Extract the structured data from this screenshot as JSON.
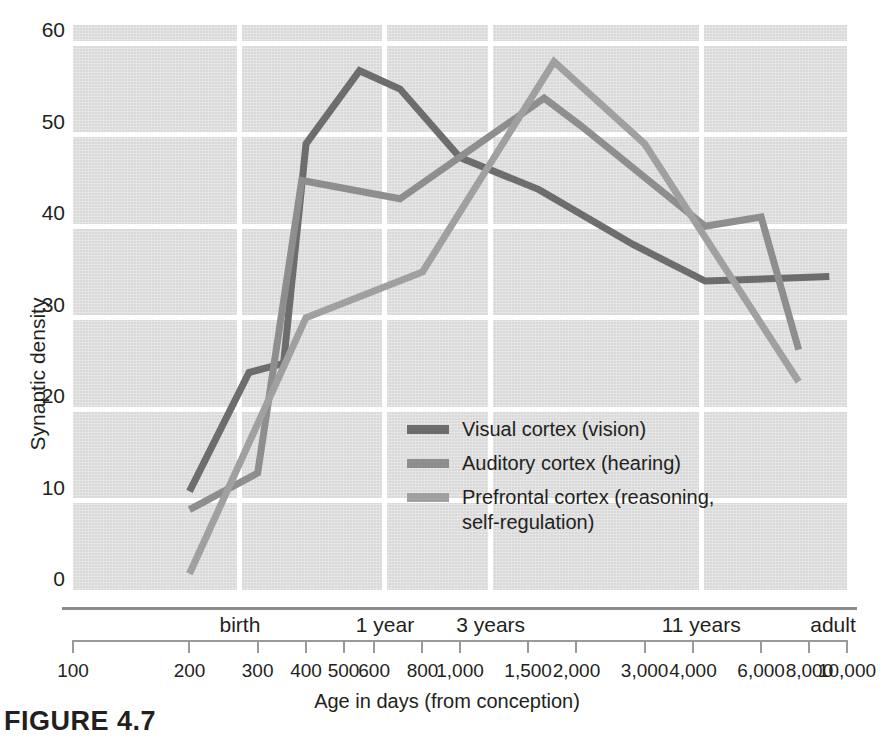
{
  "chart_data": {
    "type": "line",
    "title": "",
    "xlabel": "Age in days (from conception)",
    "ylabel": "Synaptic density",
    "xscale": "log",
    "xlim": [
      100,
      10000
    ],
    "ylim": [
      0,
      62
    ],
    "yticks": [
      0,
      10,
      20,
      30,
      40,
      50,
      60
    ],
    "grid": true,
    "legend_position": "inside-center-left",
    "x_ruler_ticks": [
      100,
      200,
      300,
      400,
      500,
      600,
      800,
      1000,
      1500,
      2000,
      3000,
      4000,
      6000,
      8000,
      10000
    ],
    "x_ruler_labels": [
      "100",
      "200",
      "300",
      "400",
      "500",
      "600",
      "800",
      "1,000",
      "1,500",
      "2,000",
      "3,000",
      "4,000",
      "6,000",
      "8,000",
      "10,000"
    ],
    "x_stage_markers": [
      {
        "label": "birth",
        "days": 270
      },
      {
        "label": "1 year",
        "days": 640
      },
      {
        "label": "3 years",
        "days": 1200
      },
      {
        "label": "11 years",
        "days": 4200
      },
      {
        "label": "adult",
        "days": 9200
      }
    ],
    "gridlines_x_days": [
      270,
      640,
      1200,
      4200
    ],
    "series": [
      {
        "name": "Visual cortex (vision)",
        "color": "#6d6d6d",
        "points": [
          [
            200,
            11.0
          ],
          [
            285,
            24.0
          ],
          [
            350,
            25.0
          ],
          [
            400,
            49.0
          ],
          [
            550,
            57.0
          ],
          [
            700,
            55.0
          ],
          [
            1000,
            47.5
          ],
          [
            1600,
            44.0
          ],
          [
            2800,
            38.0
          ],
          [
            4300,
            34.0
          ],
          [
            9000,
            34.5
          ]
        ]
      },
      {
        "name": "Auditory cortex (hearing)",
        "color": "#8e8e8e",
        "points": [
          [
            200,
            9.0
          ],
          [
            300,
            13.0
          ],
          [
            390,
            45.0
          ],
          [
            700,
            43.0
          ],
          [
            1650,
            54.0
          ],
          [
            2050,
            51.0
          ],
          [
            4300,
            40.0
          ],
          [
            6000,
            41.0
          ],
          [
            7500,
            26.5
          ]
        ]
      },
      {
        "name": "Prefrontal cortex (reasoning, self-regulation)",
        "color": "#a0a0a0",
        "points": [
          [
            200,
            2.0
          ],
          [
            400,
            30.0
          ],
          [
            800,
            35.0
          ],
          [
            1750,
            58.0
          ],
          [
            3000,
            49.0
          ],
          [
            7500,
            23.0
          ]
        ]
      }
    ]
  },
  "legend": {
    "items": [
      {
        "label": "Visual cortex (vision)",
        "color": "#6d6d6d"
      },
      {
        "label": "Auditory cortex (hearing)",
        "color": "#8e8e8e"
      },
      {
        "label": "Prefrontal cortex (reasoning,\nself-regulation)",
        "color": "#a0a0a0"
      }
    ]
  },
  "caption": {
    "text": "FIGURE 4.7"
  }
}
